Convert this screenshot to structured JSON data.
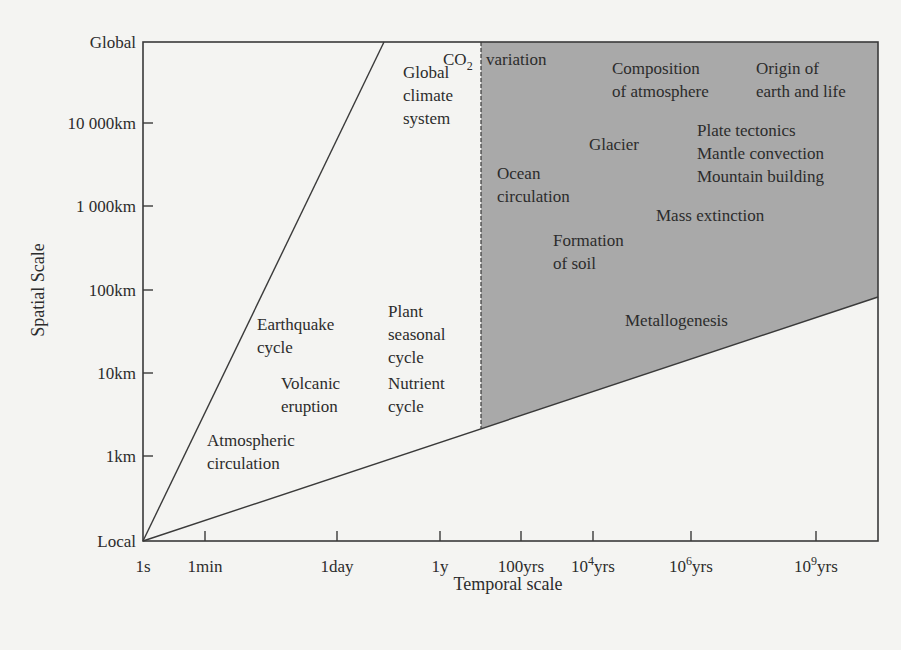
{
  "chart_data": {
    "type": "diagram",
    "title": "",
    "xlabel": "Temporal scale",
    "ylabel": "Spatial Scale",
    "x_ticks": [
      "1s",
      "1min",
      "1day",
      "1y",
      "100yrs",
      "10^4yrs",
      "10^6yrs",
      "10^9yrs"
    ],
    "y_ticks": [
      "Local",
      "1km",
      "10km",
      "100km",
      "1 000km",
      "10 000km",
      "Global"
    ],
    "regions": [
      {
        "name": "short-timescale wedge",
        "shaded": false,
        "description": "between steep line from 1s/Local to Global and low line from 1s/Local"
      },
      {
        "name": "long-timescale geological domain",
        "shaded": true,
        "fill": "#a9a9a9",
        "left_boundary": "dashed line at ~100yrs",
        "description": "above low sloped line, from ~100yrs to beyond 10^9yrs"
      }
    ],
    "phenomena": [
      {
        "label": "Global climate system",
        "lines": [
          "Global",
          "climate",
          "system"
        ]
      },
      {
        "label": "CO2 variation",
        "lines": [
          "CO",
          "2",
          "variation"
        ]
      },
      {
        "label": "Composition of atmosphere",
        "lines": [
          "Composition",
          "of atmosphere"
        ]
      },
      {
        "label": "Origin of earth and life",
        "lines": [
          "Origin of",
          "earth and life"
        ]
      },
      {
        "label": "Glacier",
        "lines": [
          "Glacier"
        ]
      },
      {
        "label": "Plate tectonics / Mantle convection / Mountain building",
        "lines": [
          "Plate tectonics",
          "Mantle convection",
          "Mountain building"
        ]
      },
      {
        "label": "Ocean circulation",
        "lines": [
          "Ocean",
          "circulation"
        ]
      },
      {
        "label": "Mass extinction",
        "lines": [
          "Mass extinction"
        ]
      },
      {
        "label": "Formation of soil",
        "lines": [
          "Formation",
          "of soil"
        ]
      },
      {
        "label": "Metallogenesis",
        "lines": [
          "Metallogenesis"
        ]
      },
      {
        "label": "Earthquake cycle",
        "lines": [
          "Earthquake",
          "cycle"
        ]
      },
      {
        "label": "Plant seasonal cycle",
        "lines": [
          "Plant",
          "seasonal",
          "cycle"
        ]
      },
      {
        "label": "Volcanic eruption",
        "lines": [
          "Volcanic",
          "eruption"
        ]
      },
      {
        "label": "Nutrient cycle",
        "lines": [
          "Nutrient",
          "cycle"
        ]
      },
      {
        "label": "Atmospheric circulation",
        "lines": [
          "Atmospheric",
          "circulation"
        ]
      }
    ]
  },
  "colors": {
    "background": "#f4f4f2",
    "line": "#3a3a3a",
    "shaded_region": "#a9a9a9",
    "text": "#2c2c2c"
  }
}
